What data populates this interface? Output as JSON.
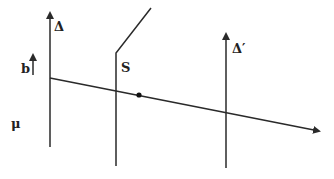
{
  "diagram": {
    "labels": {
      "delta": "Δ",
      "delta_prime": "Δ′",
      "S": "S",
      "b": "b",
      "mu": "μ"
    },
    "elements": {
      "axis_delta": {
        "x": 50,
        "y_top": 10,
        "y_bottom": 147
      },
      "axis_delta_prime": {
        "x": 226,
        "y_top": 31,
        "y_bottom": 168
      },
      "surface_S": {
        "x": 116,
        "y_bend": 53,
        "y_bottom": 166,
        "end_x": 151,
        "end_y": 8
      },
      "vector_b": {
        "x": 33,
        "y_top": 52,
        "y_bottom": 75
      },
      "ray": {
        "x1": 50,
        "y1": 78,
        "x2": 322,
        "y2": 132
      },
      "point": {
        "x": 139,
        "y": 95
      }
    },
    "colors": {
      "stroke": "#2a2a2a",
      "background": "#ffffff"
    }
  }
}
